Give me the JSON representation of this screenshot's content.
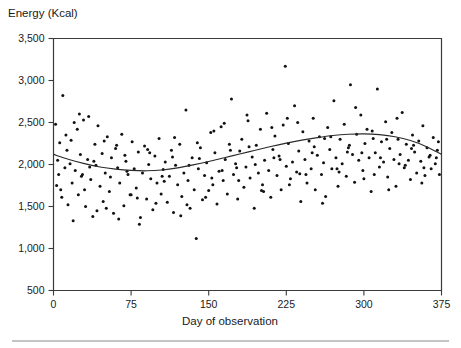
{
  "chart_data": {
    "type": "scatter",
    "title": "",
    "ylabel": "Energy (Kcal)",
    "xlabel": "Day of observation",
    "xlim": [
      0,
      375
    ],
    "ylim": [
      500,
      3500
    ],
    "xticks": [
      0,
      75,
      150,
      225,
      300,
      375
    ],
    "yticks": [
      500,
      1000,
      1500,
      2000,
      2500,
      3000,
      3500
    ],
    "xtick_labels": [
      "0",
      "75",
      "150",
      "225",
      "300",
      "375"
    ],
    "ytick_labels": [
      "500",
      "1,000",
      "1,500",
      "2,000",
      "2,500",
      "3,000",
      "3,500"
    ],
    "grid": false,
    "legend": null,
    "marker_color": "#111111",
    "marker_size_px": 3,
    "series": [
      {
        "name": "Daily energy intake",
        "type": "scatter",
        "points": [
          [
            2,
            2480
          ],
          [
            4,
            2050
          ],
          [
            5,
            1880
          ],
          [
            6,
            2260
          ],
          [
            7,
            1700
          ],
          [
            9,
            2820
          ],
          [
            11,
            1960
          ],
          [
            13,
            2170
          ],
          [
            14,
            1520
          ],
          [
            16,
            2010
          ],
          [
            18,
            1780
          ],
          [
            20,
            2500
          ],
          [
            21,
            1930
          ],
          [
            23,
            2420
          ],
          [
            24,
            1640
          ],
          [
            26,
            2120
          ],
          [
            27,
            1860
          ],
          [
            29,
            2530
          ],
          [
            31,
            1500
          ],
          [
            33,
            2060
          ],
          [
            34,
            2570
          ],
          [
            36,
            1820
          ],
          [
            38,
            1380
          ],
          [
            40,
            2240
          ],
          [
            41,
            1990
          ],
          [
            43,
            2460
          ],
          [
            45,
            1740
          ],
          [
            47,
            2130
          ],
          [
            48,
            1560
          ],
          [
            50,
            1900
          ],
          [
            52,
            2330
          ],
          [
            54,
            1680
          ],
          [
            56,
            2080
          ],
          [
            58,
            1420
          ],
          [
            60,
            2190
          ],
          [
            62,
            1960
          ],
          [
            64,
            1780
          ],
          [
            66,
            2360
          ],
          [
            68,
            1510
          ],
          [
            70,
            2040
          ],
          [
            72,
            1880
          ],
          [
            74,
            1640
          ],
          [
            76,
            2270
          ],
          [
            78,
            1950
          ],
          [
            80,
            1720
          ],
          [
            82,
            2150
          ],
          [
            84,
            1370
          ],
          [
            86,
            1900
          ],
          [
            88,
            2220
          ],
          [
            90,
            1590
          ],
          [
            92,
            2000
          ],
          [
            94,
            1830
          ],
          [
            96,
            1460
          ],
          [
            98,
            2100
          ],
          [
            100,
            1780
          ],
          [
            102,
            2310
          ],
          [
            104,
            1650
          ],
          [
            106,
            1940
          ],
          [
            108,
            2030
          ],
          [
            110,
            1550
          ],
          [
            112,
            1860
          ],
          [
            114,
            2170
          ],
          [
            116,
            1430
          ],
          [
            118,
            1990
          ],
          [
            120,
            1760
          ],
          [
            122,
            2240
          ],
          [
            124,
            1620
          ],
          [
            126,
            1900
          ],
          [
            128,
            2650
          ],
          [
            130,
            1810
          ],
          [
            132,
            1480
          ],
          [
            134,
            2080
          ],
          [
            136,
            1700
          ],
          [
            138,
            1120
          ],
          [
            140,
            1950
          ],
          [
            142,
            2200
          ],
          [
            144,
            1580
          ],
          [
            146,
            1870
          ],
          [
            148,
            2020
          ],
          [
            150,
            1690
          ],
          [
            152,
            2380
          ],
          [
            154,
            1760
          ],
          [
            156,
            2140
          ],
          [
            158,
            1530
          ],
          [
            160,
            1920
          ],
          [
            162,
            2450
          ],
          [
            164,
            1810
          ],
          [
            166,
            2060
          ],
          [
            168,
            1650
          ],
          [
            170,
            2240
          ],
          [
            172,
            2780
          ],
          [
            174,
            1880
          ],
          [
            176,
            2010
          ],
          [
            178,
            1590
          ],
          [
            180,
            2160
          ],
          [
            182,
            2300
          ],
          [
            184,
            1730
          ],
          [
            186,
            1970
          ],
          [
            188,
            2520
          ],
          [
            190,
            1840
          ],
          [
            192,
            2090
          ],
          [
            194,
            1480
          ],
          [
            196,
            2230
          ],
          [
            198,
            1900
          ],
          [
            200,
            2420
          ],
          [
            202,
            1760
          ],
          [
            204,
            2050
          ],
          [
            206,
            2610
          ],
          [
            208,
            1930
          ],
          [
            210,
            1610
          ],
          [
            212,
            2180
          ],
          [
            214,
            2340
          ],
          [
            216,
            1870
          ],
          [
            218,
            2100
          ],
          [
            220,
            1700
          ],
          [
            222,
            2470
          ],
          [
            224,
            3170
          ],
          [
            225,
            1980
          ],
          [
            227,
            2250
          ],
          [
            229,
            1830
          ],
          [
            231,
            2030
          ],
          [
            233,
            2700
          ],
          [
            235,
            1910
          ],
          [
            237,
            2160
          ],
          [
            239,
            1560
          ],
          [
            241,
            2390
          ],
          [
            243,
            2060
          ],
          [
            245,
            1780
          ],
          [
            247,
            2280
          ],
          [
            249,
            1950
          ],
          [
            251,
            2550
          ],
          [
            253,
            1700
          ],
          [
            255,
            2110
          ],
          [
            257,
            2330
          ],
          [
            259,
            1880
          ],
          [
            261,
            2020
          ],
          [
            263,
            1620
          ],
          [
            265,
            2440
          ],
          [
            267,
            2180
          ],
          [
            269,
            1950
          ],
          [
            271,
            2760
          ],
          [
            273,
            2080
          ],
          [
            275,
            1740
          ],
          [
            277,
            2300
          ],
          [
            279,
            2010
          ],
          [
            281,
            2480
          ],
          [
            283,
            1860
          ],
          [
            285,
            2200
          ],
          [
            287,
            2950
          ],
          [
            289,
            2120
          ],
          [
            291,
            1790
          ],
          [
            293,
            2360
          ],
          [
            295,
            2050
          ],
          [
            297,
            2590
          ],
          [
            299,
            1930
          ],
          [
            301,
            2250
          ],
          [
            303,
            2420
          ],
          [
            305,
            2080
          ],
          [
            307,
            1680
          ],
          [
            309,
            2310
          ],
          [
            311,
            2140
          ],
          [
            313,
            2900
          ],
          [
            315,
            1970
          ],
          [
            317,
            2270
          ],
          [
            319,
            2030
          ],
          [
            321,
            2510
          ],
          [
            323,
            1850
          ],
          [
            325,
            2190
          ],
          [
            327,
            2380
          ],
          [
            329,
            2060
          ],
          [
            331,
            1740
          ],
          [
            333,
            2300
          ],
          [
            335,
            2120
          ],
          [
            337,
            2620
          ],
          [
            339,
            1960
          ],
          [
            341,
            2240
          ],
          [
            343,
            2050
          ],
          [
            345,
            1820
          ],
          [
            347,
            2350
          ],
          [
            349,
            2150
          ],
          [
            351,
            1900
          ],
          [
            353,
            2280
          ],
          [
            355,
            2040
          ],
          [
            357,
            2460
          ],
          [
            359,
            1870
          ],
          [
            361,
            2200
          ],
          [
            363,
            2090
          ],
          [
            365,
            1950
          ],
          [
            367,
            2320
          ],
          [
            369,
            2010
          ],
          [
            371,
            2170
          ],
          [
            373,
            1880
          ],
          [
            8,
            1610
          ],
          [
            12,
            2350
          ],
          [
            19,
            1330
          ],
          [
            25,
            2600
          ],
          [
            30,
            1700
          ],
          [
            35,
            1970
          ],
          [
            42,
            1450
          ],
          [
            49,
            2280
          ],
          [
            55,
            1850
          ],
          [
            63,
            1350
          ],
          [
            69,
            2110
          ],
          [
            75,
            1640
          ],
          [
            83,
            1290
          ],
          [
            91,
            2180
          ],
          [
            99,
            1540
          ],
          [
            107,
            1800
          ],
          [
            115,
            2090
          ],
          [
            123,
            1390
          ],
          [
            131,
            1990
          ],
          [
            139,
            2260
          ],
          [
            147,
            1610
          ],
          [
            155,
            2400
          ],
          [
            163,
            1930
          ],
          [
            171,
            2170
          ],
          [
            179,
            1810
          ],
          [
            187,
            2590
          ],
          [
            195,
            2000
          ],
          [
            203,
            1680
          ],
          [
            211,
            2440
          ],
          [
            219,
            2060
          ],
          [
            228,
            1760
          ],
          [
            236,
            2500
          ],
          [
            244,
            1880
          ],
          [
            252,
            2210
          ],
          [
            260,
            1540
          ],
          [
            268,
            2330
          ],
          [
            276,
            1910
          ],
          [
            284,
            2150
          ],
          [
            292,
            2680
          ],
          [
            300,
            1830
          ],
          [
            308,
            2400
          ],
          [
            316,
            2080
          ],
          [
            324,
            1700
          ],
          [
            332,
            2550
          ],
          [
            340,
            1990
          ],
          [
            348,
            2230
          ],
          [
            356,
            1780
          ],
          [
            364,
            2110
          ],
          [
            372,
            2270
          ],
          [
            3,
            1750
          ],
          [
            17,
            2290
          ],
          [
            28,
            1880
          ],
          [
            39,
            2040
          ],
          [
            51,
            1480
          ],
          [
            61,
            2230
          ],
          [
            71,
            1920
          ],
          [
            81,
            1600
          ],
          [
            93,
            2140
          ],
          [
            105,
            1860
          ],
          [
            117,
            2320
          ],
          [
            129,
            1520
          ],
          [
            141,
            2070
          ],
          [
            153,
            1840
          ],
          [
            165,
            2490
          ],
          [
            177,
            1960
          ],
          [
            189,
            2210
          ],
          [
            201,
            1690
          ],
          [
            213,
            2080
          ],
          [
            226,
            2550
          ],
          [
            238,
            1890
          ],
          [
            250,
            2140
          ],
          [
            262,
            2310
          ],
          [
            274,
            1950
          ],
          [
            286,
            2230
          ],
          [
            298,
            2140
          ],
          [
            310,
            1880
          ],
          [
            322,
            2300
          ],
          [
            334,
            2010
          ],
          [
            346,
            2190
          ],
          [
            358,
            1960
          ],
          [
            370,
            2080
          ]
        ]
      },
      {
        "name": "Smoothed trend",
        "type": "line",
        "points": [
          [
            0,
            2120
          ],
          [
            15,
            2060
          ],
          [
            30,
            2010
          ],
          [
            45,
            1970
          ],
          [
            60,
            1945
          ],
          [
            75,
            1930
          ],
          [
            90,
            1925
          ],
          [
            105,
            1935
          ],
          [
            120,
            1960
          ],
          [
            135,
            1995
          ],
          [
            150,
            2035
          ],
          [
            165,
            2080
          ],
          [
            180,
            2125
          ],
          [
            195,
            2170
          ],
          [
            210,
            2215
          ],
          [
            225,
            2255
          ],
          [
            240,
            2290
          ],
          [
            255,
            2320
          ],
          [
            270,
            2345
          ],
          [
            285,
            2360
          ],
          [
            300,
            2365
          ],
          [
            315,
            2355
          ],
          [
            330,
            2330
          ],
          [
            345,
            2285
          ],
          [
            360,
            2215
          ],
          [
            375,
            2120
          ]
        ]
      }
    ]
  },
  "footer": {
    "rule": true
  }
}
